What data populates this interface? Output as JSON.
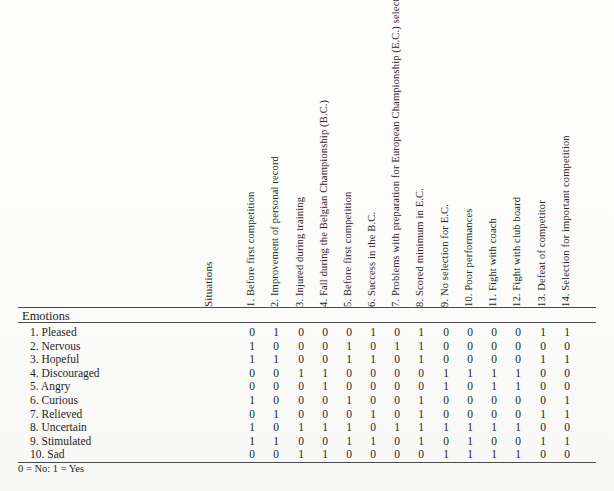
{
  "table": {
    "column_group_label": "Situations",
    "row_group_label": "Emotions",
    "footnote": "0 = No:  1 = Yes",
    "situations": [
      "1. Before first competition",
      "2. Improvement of personal record",
      "3. Injured during training",
      "4. Fall during the Belgian Championship (B.C.)",
      "5. Before first competition",
      "6. Success in the B.C.",
      "7. Problems with preparation for European Championship (E.C.) selection",
      "8. Scored minimum in E.C.",
      "9. No selection for E.C.",
      "10. Poor performances",
      "11. Fight with coach",
      "12. Fight with club board",
      "13. Defeat of competitor",
      "14. Selection for important competition"
    ],
    "emotions": [
      "1. Pleased",
      "2. Nervous",
      "3. Hopeful",
      "4. Discouraged",
      "5. Angry",
      "6. Curious",
      "7. Relieved",
      "8. Uncertain",
      "9. Stimulated",
      "10. Sad"
    ],
    "matrix": [
      [
        0,
        1,
        0,
        0,
        0,
        1,
        0,
        1,
        0,
        0,
        0,
        0,
        1,
        1
      ],
      [
        1,
        0,
        0,
        0,
        1,
        0,
        1,
        1,
        0,
        0,
        0,
        0,
        0,
        0
      ],
      [
        1,
        1,
        0,
        0,
        1,
        1,
        0,
        1,
        0,
        0,
        0,
        0,
        1,
        1
      ],
      [
        0,
        0,
        1,
        1,
        0,
        0,
        0,
        0,
        1,
        1,
        1,
        1,
        0,
        0
      ],
      [
        0,
        0,
        0,
        1,
        0,
        0,
        0,
        0,
        1,
        0,
        1,
        1,
        0,
        0
      ],
      [
        1,
        0,
        0,
        0,
        1,
        0,
        0,
        1,
        0,
        0,
        0,
        0,
        0,
        1
      ],
      [
        0,
        1,
        0,
        0,
        0,
        1,
        0,
        1,
        0,
        0,
        0,
        0,
        1,
        1
      ],
      [
        1,
        0,
        1,
        1,
        1,
        0,
        1,
        1,
        1,
        1,
        1,
        1,
        0,
        0
      ],
      [
        1,
        1,
        0,
        0,
        1,
        1,
        0,
        1,
        0,
        1,
        0,
        0,
        1,
        1
      ],
      [
        0,
        0,
        1,
        1,
        0,
        0,
        0,
        0,
        1,
        1,
        1,
        1,
        0,
        0
      ]
    ]
  }
}
